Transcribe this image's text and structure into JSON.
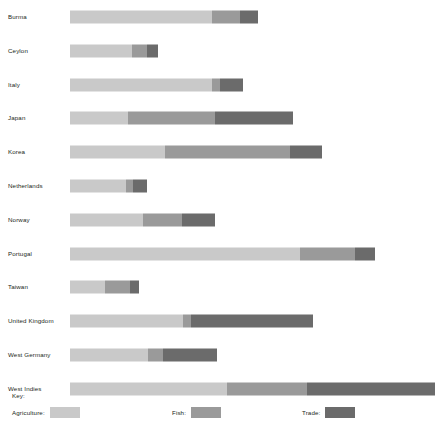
{
  "chart_data": {
    "type": "bar",
    "title": "",
    "subtitle": "",
    "xlabel": "",
    "ylabel": "",
    "orientation": "horizontal",
    "stacked": true,
    "grid": false,
    "axis_visible": false,
    "xlim": [
      0,
      100
    ],
    "legend_position": "bottom",
    "categories": [
      "Burma",
      "Ceylon",
      "Italy",
      "Japan",
      "Korea",
      "Netherlands",
      "Norway",
      "Portugal",
      "Taiwan",
      "United Kingdom",
      "West Germany",
      "West Indies"
    ],
    "series": [
      {
        "name": "Agriculture",
        "color": "#c9c9c9",
        "values": [
          38.9,
          17.0,
          38.9,
          15.9,
          26.0,
          15.3,
          20.0,
          63.0,
          9.6,
          31.0,
          21.4,
          43.0
        ]
      },
      {
        "name": "Fish",
        "color": "#9a9a9a",
        "values": [
          7.7,
          4.1,
          2.2,
          23.8,
          34.2,
          1.9,
          10.7,
          15.1,
          6.8,
          2.2,
          4.1,
          22.0
        ]
      },
      {
        "name": "Trade",
        "color": "#6b6b6b",
        "values": [
          4.9,
          3.0,
          6.3,
          21.4,
          8.8,
          3.8,
          9.0,
          5.5,
          2.5,
          33.4,
          14.8,
          35.0
        ]
      }
    ],
    "totals": [
      51.5,
      24.1,
      47.4,
      61.1,
      69.0,
      21.0,
      39.7,
      83.6,
      18.9,
      66.6,
      40.3,
      100.0
    ]
  },
  "legend": {
    "title": "Key:",
    "entries": [
      {
        "label": "Agriculture:",
        "color": "#c9c9c9"
      },
      {
        "label": "Fish:",
        "color": "#9a9a9a"
      },
      {
        "label": "Trade:",
        "color": "#6b6b6b"
      }
    ]
  }
}
